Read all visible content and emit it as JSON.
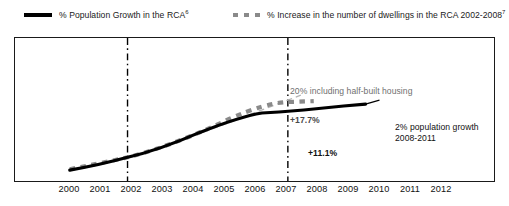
{
  "legend": {
    "entries": [
      {
        "name": "population-growth",
        "label": "% Population Growth in the RCA",
        "footnote": "6",
        "style": "solid",
        "color": "#000000"
      },
      {
        "name": "dwellings-increase",
        "label": "% Increase in the number of dwellings in the RCA 2002-2008",
        "footnote": "7",
        "style": "dashed",
        "color": "#8a8a8a"
      }
    ]
  },
  "annotations": {
    "half_built_housing": "20% including half-built housing",
    "dwellings_value": "+17.7%",
    "population_value": "+11.1%",
    "population_note_line1": "2% population growth",
    "population_note_line2": "2008-2011"
  },
  "chart_data": {
    "type": "line",
    "title": "",
    "subtitle": "",
    "xlabel": "",
    "ylabel": "",
    "grid": false,
    "legend_position": "top",
    "xlim": [
      2000,
      2012
    ],
    "ylim": [
      0,
      25
    ],
    "x": [
      2000,
      2001,
      2002,
      2003,
      2004,
      2005,
      2006,
      2007,
      2008,
      2009,
      2010,
      2011,
      2012
    ],
    "tick_labels": [
      "2000",
      "2001",
      "2002",
      "2003",
      "2004",
      "2005",
      "2006",
      "2007",
      "2008",
      "2009",
      "2010",
      "2011",
      "2012"
    ],
    "vertical_markers": [
      {
        "x": 2002,
        "style": "dash-dot",
        "color": "#000000"
      },
      {
        "x": 2008,
        "style": "dash-dot",
        "color": "#000000"
      }
    ],
    "series": [
      {
        "name": "% Population Growth in the RCA",
        "style": "solid",
        "color": "#000000",
        "width": 3,
        "x": [
          2000,
          2001,
          2002,
          2003,
          2004,
          2005,
          2006,
          2007,
          2008,
          2009,
          2010,
          2011
        ],
        "values": [
          0.6,
          1.5,
          2.6,
          3.6,
          4.7,
          6.2,
          7.9,
          9.7,
          11.1,
          11.8,
          12.1,
          13.1
        ],
        "end_label": "+11.1%"
      },
      {
        "name": "% Increase in the number of dwellings in the RCA 2002-2008",
        "style": "dashed",
        "color": "#8a8a8a",
        "width": 4,
        "x": [
          2000,
          2001,
          2002,
          2003,
          2004,
          2005,
          2006,
          2007,
          2008,
          2009
        ],
        "values": [
          0.6,
          1.6,
          2.7,
          5.2,
          7.8,
          10.4,
          13.0,
          15.6,
          17.7,
          17.7
        ],
        "end_label": "+17.7%"
      },
      {
        "name": "20% including half-built housing",
        "style": "dashed-thin",
        "color": "#b0b0b0",
        "width": 1.3,
        "x": [
          2002,
          2003,
          2004,
          2005,
          2006,
          2007,
          2008
        ],
        "values": [
          2.7,
          5.6,
          8.6,
          11.6,
          14.6,
          17.5,
          20.0
        ],
        "end_label": "20% including half-built housing"
      }
    ]
  }
}
